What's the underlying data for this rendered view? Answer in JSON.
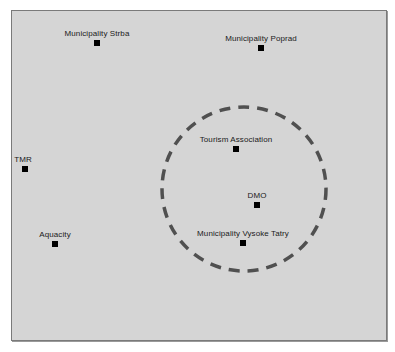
{
  "diagram": {
    "background": "#d5d5d5",
    "border_color": "#7a7a7a",
    "ring": {
      "cx": 244,
      "cy": 189,
      "r": 82,
      "stroke": "#505050",
      "style": "dashed"
    },
    "nodes": [
      {
        "id": "strba",
        "label": "Municipality Strba",
        "x": 97,
        "y": 43
      },
      {
        "id": "poprad",
        "label": "Municipality Poprad",
        "x": 261,
        "y": 48
      },
      {
        "id": "tmr",
        "label": "TMR",
        "x": 25,
        "y": 169
      },
      {
        "id": "tourism",
        "label": "Tourism Association",
        "x": 236,
        "y": 149
      },
      {
        "id": "dmo",
        "label": "DMO",
        "x": 257,
        "y": 205
      },
      {
        "id": "aquacity",
        "label": "Aquacity",
        "x": 55,
        "y": 244
      },
      {
        "id": "vysoke",
        "label": "Municipality Vysoke Tatry",
        "x": 243,
        "y": 243
      }
    ]
  }
}
